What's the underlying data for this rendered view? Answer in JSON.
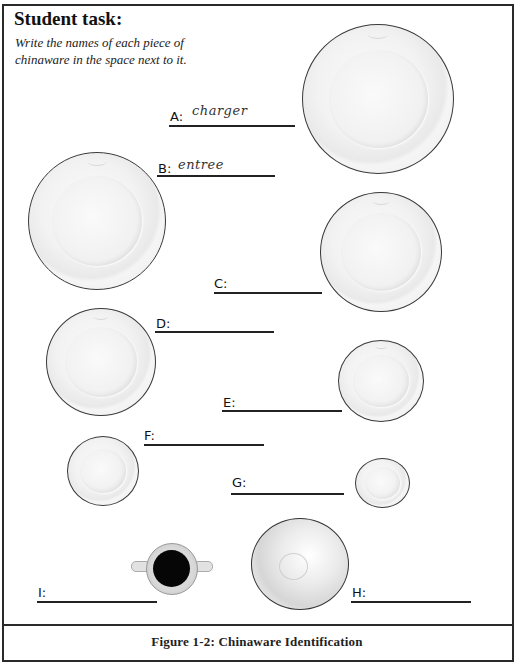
{
  "header": {
    "title": "Student task:",
    "instructions": "Write the names of each piece of chinaware in the space next to it."
  },
  "items": [
    {
      "letter": "A:",
      "answer": "charger",
      "icon": "large-charger-plate"
    },
    {
      "letter": "B:",
      "answer": "entree",
      "icon": "entree-plate"
    },
    {
      "letter": "C:",
      "answer": "",
      "icon": "dinner-plate"
    },
    {
      "letter": "D:",
      "answer": "",
      "icon": "medium-plate"
    },
    {
      "letter": "E:",
      "answer": "",
      "icon": "salad-plate"
    },
    {
      "letter": "F:",
      "answer": "",
      "icon": "side-plate"
    },
    {
      "letter": "G:",
      "answer": "",
      "icon": "saucer"
    },
    {
      "letter": "H:",
      "answer": "",
      "icon": "soup-bowl"
    },
    {
      "letter": "I:",
      "answer": "",
      "icon": "bouillon-cup"
    }
  ],
  "caption": "Figure 1-2:  Chinaware Identification"
}
